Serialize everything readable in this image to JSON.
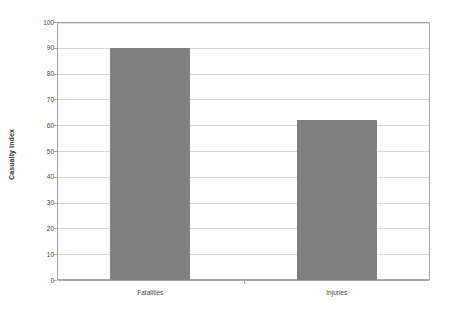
{
  "chart_data": {
    "type": "bar",
    "title": "",
    "subtitle": "",
    "categories": [
      "Fatalities",
      "Injuries"
    ],
    "values": [
      90,
      62
    ],
    "series": [
      {
        "name": "Casualty Index",
        "values": [
          90,
          62
        ]
      }
    ],
    "xlabel": "",
    "ylabel": "Casualty Index",
    "ylim": [
      0,
      100
    ],
    "ytick_labels": [
      "0",
      "10",
      "20",
      "30",
      "40",
      "50",
      "60",
      "70",
      "80",
      "90",
      "100"
    ],
    "ytick_values": [
      0,
      10,
      20,
      30,
      40,
      50,
      60,
      70,
      80,
      90,
      100
    ],
    "grid": "horizontal",
    "legend": "none",
    "colors": {
      "bar_fill": "#7f7f7f",
      "gridline": "#d9d9d9",
      "axis_line": "#a6a6a6",
      "text": "#3f3f3f",
      "background": "#ffffff"
    }
  }
}
